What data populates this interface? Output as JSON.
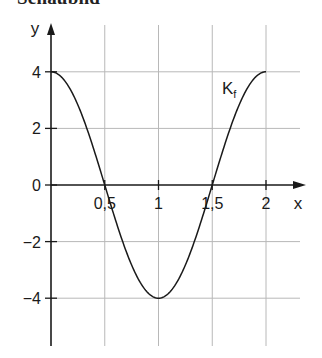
{
  "title": "Schaubild",
  "chart_data": {
    "type": "line",
    "title": "Schaubild",
    "xlabel": "x",
    "ylabel": "y",
    "xlim": [
      0,
      2
    ],
    "ylim": [
      -5.5,
      5.5
    ],
    "x_ticks": [
      0.5,
      1,
      1.5,
      2
    ],
    "x_tick_labels": [
      "0,5",
      "1",
      "1,5",
      "2"
    ],
    "y_ticks": [
      4,
      2,
      0,
      -2,
      -4
    ],
    "y_tick_labels": [
      "4",
      "2",
      "0",
      "−2",
      "−4"
    ],
    "grid": true,
    "series": [
      {
        "name": "K_f",
        "label_main": "K",
        "label_sub": "f",
        "function": "4*cos(pi*x)",
        "x": [
          0,
          0.25,
          0.5,
          0.75,
          1,
          1.25,
          1.5,
          1.75,
          2
        ],
        "y": [
          4,
          2.83,
          0,
          -2.83,
          -4,
          -2.83,
          0,
          2.83,
          4
        ]
      }
    ],
    "colors": {
      "axis": "#1a1a1a",
      "grid": "#b8b8b8",
      "curve": "#1a1a1a"
    }
  }
}
